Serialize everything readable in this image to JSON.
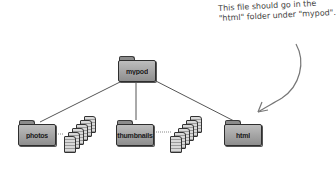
{
  "diagram": {
    "root_folder": {
      "label": "mypod"
    },
    "child_folders": [
      {
        "label": "photos",
        "has_files": true
      },
      {
        "label": "thumbnails",
        "has_files": true
      },
      {
        "label": "html",
        "has_files": false
      }
    ],
    "annotation": {
      "line1": "This file should go in the",
      "line2": "\"html\" folder under \"mypod\".",
      "arrow_target": "html"
    },
    "colors": {
      "folder_fill": "#a8a8a8",
      "folder_stroke": "#2e2e2e",
      "connector": "#555555",
      "annotation_text": "#444444"
    }
  }
}
